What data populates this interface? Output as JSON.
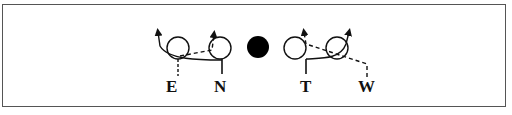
{
  "diagram": {
    "colors": {
      "stroke": "#111111",
      "frame": "#555555",
      "ball": "#000000"
    },
    "labels": {
      "e": "E",
      "n": "N",
      "t": "T",
      "w": "W"
    }
  }
}
